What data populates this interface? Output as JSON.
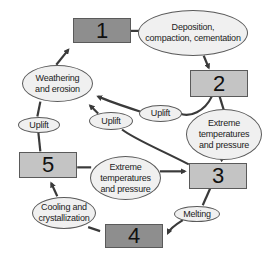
{
  "diagram": {
    "type": "rock-cycle",
    "nodes": [
      {
        "id": "box1",
        "label": "1",
        "shade": "dark"
      },
      {
        "id": "box2",
        "label": "2",
        "shade": "light"
      },
      {
        "id": "box3",
        "label": "3",
        "shade": "light"
      },
      {
        "id": "box4",
        "label": "4",
        "shade": "dark"
      },
      {
        "id": "box5",
        "label": "5",
        "shade": "light"
      }
    ],
    "processes": {
      "deposition": "Deposition, compaction, cementation",
      "deposition_line1": "Deposition,",
      "deposition_line2": "compaction, cementation",
      "uplift_top": "Uplift",
      "extreme_right_line1": "Extreme",
      "extreme_right_line2": "temperatures",
      "extreme_right_line3": "and pressure",
      "weathering_line1": "Weathering",
      "weathering_line2": "and erosion",
      "uplift_left": "Uplift",
      "uplift_mid": "Uplift",
      "extreme_mid_line1": "Extreme",
      "extreme_mid_line2": "temperatures",
      "extreme_mid_line3": "and pressure",
      "melting": "Melting",
      "cooling_line1": "Cooling and",
      "cooling_line2": "crystallization"
    },
    "edges": [
      {
        "from": "box1",
        "via": "Deposition, compaction, cementation",
        "to": "box2"
      },
      {
        "from": "box2",
        "via": "Uplift",
        "to": "Weathering and erosion"
      },
      {
        "from": "box2",
        "via": "Extreme temperatures and pressure",
        "to": "box3"
      },
      {
        "from": "box3",
        "via": "Uplift",
        "to": "Weathering and erosion"
      },
      {
        "from": "box3",
        "via": "Melting",
        "to": "box4"
      },
      {
        "from": "box4",
        "via": "Cooling and crystallization",
        "to": "box5"
      },
      {
        "from": "box5",
        "via": "Extreme temperatures and pressure",
        "to": "box3"
      },
      {
        "from": "box5",
        "via": "Uplift",
        "to": "Weathering and erosion"
      },
      {
        "from": "Weathering and erosion",
        "to": "box1"
      }
    ],
    "colors": {
      "dark_box": "#8e8e8e",
      "light_box": "#c4c4c4",
      "oval_fill": "#f0f0f0",
      "line": "#3a3a3a"
    }
  }
}
